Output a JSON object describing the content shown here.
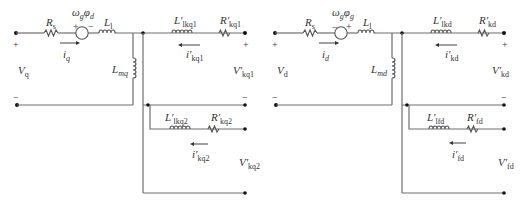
{
  "diagram": {
    "circuits": [
      {
        "id": "q-axis",
        "offset_x": 0,
        "source_polarity": "plus-left",
        "labels": {
          "rs": {
            "main": "R",
            "sub": "s"
          },
          "emf": {
            "main": "ω",
            "sub1": "g",
            "mid": "φ",
            "sub2": "d"
          },
          "l1": {
            "main": "L",
            "sub": "l"
          },
          "lm": {
            "main": "L",
            "sub": "mq"
          },
          "i_in": {
            "main": "i",
            "sub": "q"
          },
          "v_in": {
            "main": "V",
            "sub": "q"
          },
          "l_k1": {
            "main": "L'",
            "sub": "lkq1"
          },
          "r_k1": {
            "main": "R'",
            "sub": "kq1"
          },
          "i_k1": {
            "main": "i'",
            "sub": "kq1"
          },
          "v_k1": {
            "main": "V'",
            "sub": "kq1"
          },
          "l_k2": {
            "main": "L'",
            "sub": "lkq2"
          },
          "r_k2": {
            "main": "R'",
            "sub": "kq2"
          },
          "i_k2": {
            "main": "i'",
            "sub": "kq2"
          },
          "v_k2": {
            "main": "V'",
            "sub": "kq2"
          }
        },
        "signs": {
          "plus": "+",
          "minus": "−"
        }
      },
      {
        "id": "d-axis",
        "offset_x": 260,
        "source_polarity": "plus-right",
        "labels": {
          "rs": {
            "main": "R",
            "sub": "s"
          },
          "emf": {
            "main": "ω",
            "sub1": "g",
            "mid": "φ",
            "sub2": "g"
          },
          "l1": {
            "main": "L",
            "sub": "l"
          },
          "lm": {
            "main": "L",
            "sub": "md"
          },
          "i_in": {
            "main": "i",
            "sub": "d"
          },
          "v_in": {
            "main": "V",
            "sub": "d"
          },
          "l_k1": {
            "main": "L'",
            "sub": "lkd"
          },
          "r_k1": {
            "main": "R'",
            "sub": "kd"
          },
          "i_k1": {
            "main": "i'",
            "sub": "kd"
          },
          "v_k1": {
            "main": "V'",
            "sub": "kd"
          },
          "l_k2": {
            "main": "L'",
            "sub": "lfd"
          },
          "r_k2": {
            "main": "R'",
            "sub": "fd"
          },
          "i_k2": {
            "main": "i'",
            "sub": "fd"
          },
          "v_k2": {
            "main": "V'",
            "sub": "fd"
          }
        },
        "signs": {
          "plus": "+",
          "minus": "−"
        }
      }
    ],
    "colors": {
      "wire": "#6e6e6e",
      "component": "#555555",
      "node": "#111111",
      "text": "#333333"
    }
  }
}
